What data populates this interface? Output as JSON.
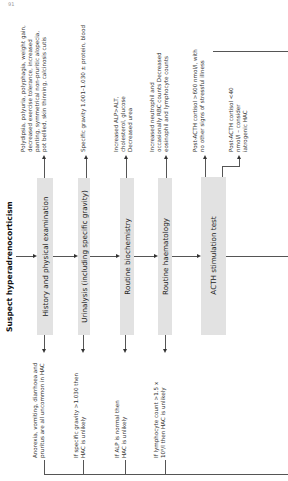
{
  "page_number": "91",
  "title": "Suspect hyperadrenocorticism",
  "steps": [
    {
      "label": "History and physical examination"
    },
    {
      "label": "Urinalysis (including specific gravity)"
    },
    {
      "label": "Routine biochemistry"
    },
    {
      "label": "Routine haematology"
    },
    {
      "label": "ACTH stimulation test"
    }
  ],
  "findings": [
    "Polydipsia, polyuria, polyphagia, weight gain, decreased exercise tolerance, increased panting, symmetrical non-pruritic alopecia, pot bellied, skin thinning, calcinosis cutis",
    "Specific gravity 1.001–1.030 ± protein, blood",
    "Increased ALP>ALT, cholesterol, glucose Decreased urea",
    "Increased neutrophil and occasionally RBC counts Decreased eosinophil and lymphocyte counts",
    "Post-ACTH cortisol >600 nmol/l, with no other signs of stressful illness",
    "Post-ACTH cortisol <40 nmol/l – consider iatrogenic HAC"
  ],
  "exclusions": [
    "Anorexia, vomiting, diarrhoea and pruritus are all uncommon in HAC",
    "If specific gravity >1.030 then HAC is unlikely",
    "If ALP is normal then HAC is unlikely",
    "If lymphocyte count >1.5 x 10⁹/l then HAC is unlikely"
  ]
}
